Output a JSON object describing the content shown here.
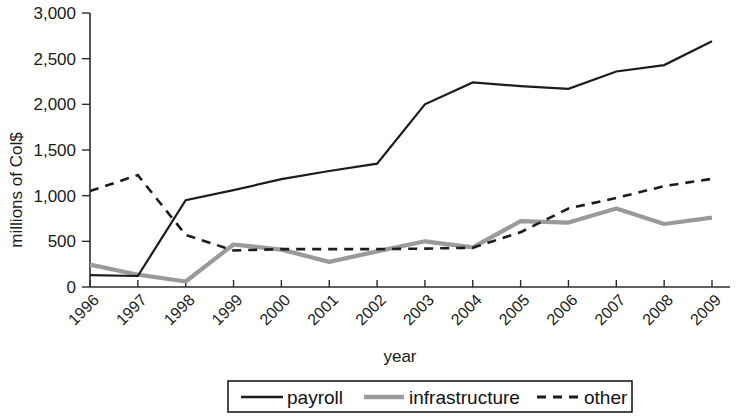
{
  "chart_data": {
    "type": "line",
    "title": "",
    "xlabel": "year",
    "ylabel": "millions of Col$",
    "categories": [
      "1996",
      "1997",
      "1998",
      "1999",
      "2000",
      "2001",
      "2002",
      "2003",
      "2004",
      "2005",
      "2006",
      "2007",
      "2008",
      "2009"
    ],
    "ylim": [
      0,
      3000
    ],
    "ytick_labels": [
      "0",
      "500",
      "1,000",
      "1,500",
      "2,000",
      "2,500",
      "3,000"
    ],
    "ytick_values": [
      0,
      500,
      1000,
      1500,
      2000,
      2500,
      3000
    ],
    "grid": false,
    "legend_position": "bottom",
    "series": [
      {
        "name": "payroll",
        "style": "solid",
        "color": "#1c1c1c",
        "values": [
          130,
          120,
          950,
          1060,
          1180,
          1270,
          1350,
          2000,
          2240,
          2200,
          2170,
          2360,
          2430,
          2690
        ]
      },
      {
        "name": "infrastructure",
        "style": "thick-gray",
        "color": "#9a9a9a",
        "values": [
          245,
          135,
          60,
          465,
          410,
          275,
          390,
          500,
          435,
          720,
          705,
          860,
          690,
          760
        ]
      },
      {
        "name": "other",
        "style": "dashed",
        "color": "#1c1c1c",
        "values": [
          1050,
          1225,
          570,
          400,
          415,
          415,
          415,
          420,
          430,
          600,
          860,
          975,
          1105,
          1185
        ]
      }
    ]
  },
  "legend": {
    "entries": [
      {
        "label": "payroll"
      },
      {
        "label": "infrastructure"
      },
      {
        "label": "other"
      }
    ]
  }
}
